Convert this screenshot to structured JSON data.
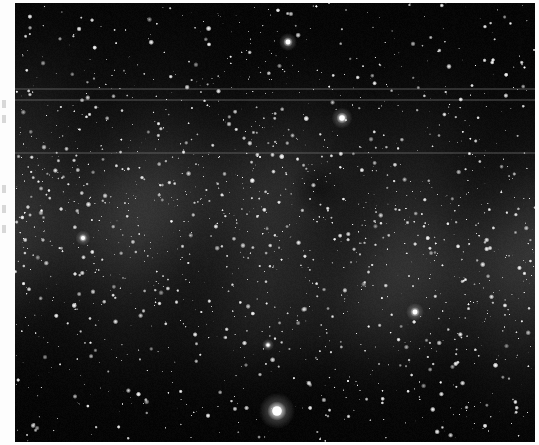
{
  "image": {
    "subject": "Milky Way star field",
    "style": "grayscale astrophotograph",
    "frame": {
      "x": 15,
      "y": 3,
      "width": 520,
      "height": 439
    },
    "background_color": "#050505",
    "page_color": "#fdfdfd",
    "milky_way_glow_color": "#3a3a3a",
    "star_color": "#ffffff",
    "horizontal_bands_y": [
      88,
      99,
      152
    ],
    "bright_stars": [
      {
        "x": 288,
        "y": 42,
        "size": 3
      },
      {
        "x": 342,
        "y": 118,
        "size": 3.5
      },
      {
        "x": 277,
        "y": 411,
        "size": 6
      },
      {
        "x": 415,
        "y": 312,
        "size": 3
      },
      {
        "x": 83,
        "y": 238,
        "size": 2.5
      },
      {
        "x": 268,
        "y": 345,
        "size": 2
      }
    ],
    "dark_nebula": {
      "x": 318,
      "y": 188,
      "radius": 14
    }
  },
  "margin": {
    "marks_y": [
      100,
      115,
      185,
      205,
      225
    ]
  }
}
